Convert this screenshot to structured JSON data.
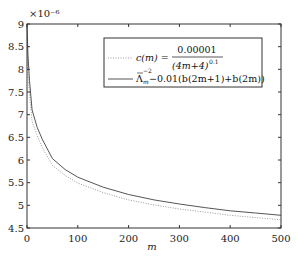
{
  "chart_data": {
    "type": "line",
    "title": "",
    "xlabel": "m",
    "ylabel": "",
    "y_multiplier_label": "×10⁻⁶",
    "xlim": [
      0,
      500
    ],
    "ylim": [
      4.5,
      9
    ],
    "xticks": [
      0,
      100,
      200,
      300,
      400,
      500
    ],
    "xtick_labels": [
      "0",
      "100",
      "200",
      "300",
      "400",
      "500"
    ],
    "yticks": [
      4.5,
      5,
      5.5,
      6,
      6.5,
      7,
      7.5,
      8,
      8.5,
      9
    ],
    "ytick_labels": [
      "4.5",
      "5",
      "5.5",
      "6",
      "6.5",
      "7",
      "7.5",
      "8",
      "8.5",
      "9"
    ],
    "grid": false,
    "legend_position": "upper right",
    "x": [
      0,
      2,
      5,
      10,
      20,
      30,
      50,
      75,
      100,
      150,
      200,
      250,
      300,
      350,
      400,
      450,
      500
    ],
    "series": [
      {
        "name": "c(m) = 0.00001 / (4m+4)^0.1",
        "style": "dotted",
        "color": "#9a9a9a",
        "values": [
          8.71,
          7.96,
          7.47,
          6.85,
          6.54,
          6.28,
          5.88,
          5.66,
          5.49,
          5.28,
          5.12,
          5.01,
          4.92,
          4.85,
          4.78,
          4.73,
          4.68
        ]
      },
      {
        "name": "Λ̄m⁻² − 0.01(b(2m+1)+b(2m))",
        "style": "solid",
        "color": "#555555",
        "values": [
          9.0,
          8.3,
          7.75,
          7.1,
          6.72,
          6.46,
          6.03,
          5.79,
          5.62,
          5.4,
          5.24,
          5.12,
          5.03,
          4.95,
          4.88,
          4.83,
          4.78
        ]
      }
    ]
  },
  "legend": {
    "entry1": {
      "lhs": "c(m) =",
      "numerator": "0.00001",
      "denominator": "(4m+4)",
      "exponent": "0.1"
    },
    "entry2": {
      "symbol": "Λ",
      "superscript": "−2",
      "subscript": "m",
      "rest": "−0.01(b(2m+1)+b(2m))"
    }
  }
}
